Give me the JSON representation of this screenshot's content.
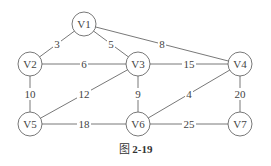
{
  "graph": {
    "nodes": [
      {
        "id": "V1",
        "label": "V1"
      },
      {
        "id": "V2",
        "label": "V2"
      },
      {
        "id": "V3",
        "label": "V3"
      },
      {
        "id": "V4",
        "label": "V4"
      },
      {
        "id": "V5",
        "label": "V5"
      },
      {
        "id": "V6",
        "label": "V6"
      },
      {
        "id": "V7",
        "label": "V7"
      }
    ],
    "edges": [
      {
        "from": "V1",
        "to": "V2",
        "weight": "3"
      },
      {
        "from": "V1",
        "to": "V3",
        "weight": "5"
      },
      {
        "from": "V1",
        "to": "V4",
        "weight": "8"
      },
      {
        "from": "V2",
        "to": "V3",
        "weight": "6"
      },
      {
        "from": "V3",
        "to": "V4",
        "weight": "15"
      },
      {
        "from": "V2",
        "to": "V5",
        "weight": "10"
      },
      {
        "from": "V3",
        "to": "V5",
        "weight": "12"
      },
      {
        "from": "V3",
        "to": "V6",
        "weight": "9"
      },
      {
        "from": "V4",
        "to": "V6",
        "weight": "4"
      },
      {
        "from": "V4",
        "to": "V7",
        "weight": "20"
      },
      {
        "from": "V5",
        "to": "V6",
        "weight": "18"
      },
      {
        "from": "V6",
        "to": "V7",
        "weight": "25"
      }
    ]
  },
  "caption": {
    "prefix": "图",
    "number": "2-19"
  }
}
